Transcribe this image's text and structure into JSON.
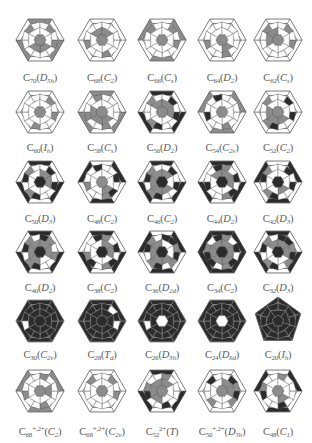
{
  "figure": {
    "colors": {
      "dark": "#2b2b2b",
      "gray": "#8c8c8c",
      "line": "#555555",
      "light": "#ffffff"
    },
    "rows": [
      {
        "cells": [
          {
            "formula": "C",
            "n": "70",
            "charge": "",
            "group": "D",
            "group_sub": "5h",
            "shape": "hex",
            "darkness": 0.15
          },
          {
            "formula": "C",
            "n": "68",
            "charge": "",
            "group": "C",
            "group_sub": "2",
            "shape": "hex",
            "darkness": 0.2
          },
          {
            "formula": "C",
            "n": "66",
            "charge": "",
            "group": "C",
            "group_sub": "s",
            "shape": "hex",
            "darkness": 0.2
          },
          {
            "formula": "C",
            "n": "64",
            "charge": "",
            "group": "D",
            "group_sub": "2",
            "shape": "hex",
            "darkness": 0.2
          },
          {
            "formula": "C",
            "n": "62",
            "charge": "",
            "group": "C",
            "group_sub": "s",
            "shape": "hex",
            "darkness": 0.2
          }
        ]
      },
      {
        "cells": [
          {
            "formula": "C",
            "n": "60",
            "charge": "",
            "group": "I",
            "group_sub": "h",
            "shape": "hex",
            "darkness": 0.2
          },
          {
            "formula": "C",
            "n": "58",
            "charge": "",
            "group": "C",
            "group_sub": "s",
            "shape": "hex",
            "darkness": 0.25
          },
          {
            "formula": "C",
            "n": "56",
            "charge": "",
            "group": "D",
            "group_sub": "2",
            "shape": "hex",
            "darkness": 0.35
          },
          {
            "formula": "C",
            "n": "54",
            "charge": "",
            "group": "C",
            "group_sub": "2v",
            "shape": "hex",
            "darkness": 0.3
          },
          {
            "formula": "C",
            "n": "52",
            "charge": "",
            "group": "C",
            "group_sub": "2",
            "shape": "hex",
            "darkness": 0.35
          }
        ]
      },
      {
        "cells": [
          {
            "formula": "C",
            "n": "50",
            "charge": "",
            "group": "D",
            "group_sub": "3",
            "shape": "hex",
            "darkness": 0.45
          },
          {
            "formula": "C",
            "n": "48",
            "charge": "",
            "group": "C",
            "group_sub": "2",
            "shape": "hex",
            "darkness": 0.4
          },
          {
            "formula": "C",
            "n": "46",
            "charge": "",
            "group": "C",
            "group_sub": "2",
            "shape": "hex",
            "darkness": 0.5
          },
          {
            "formula": "C",
            "n": "44",
            "charge": "",
            "group": "D",
            "group_sub": "2",
            "shape": "hex",
            "darkness": 0.5
          },
          {
            "formula": "C",
            "n": "42",
            "charge": "",
            "group": "D",
            "group_sub": "3",
            "shape": "hex",
            "darkness": 0.5
          }
        ]
      },
      {
        "cells": [
          {
            "formula": "C",
            "n": "40",
            "charge": "",
            "group": "D",
            "group_sub": "2",
            "shape": "hex",
            "darkness": 0.6
          },
          {
            "formula": "C",
            "n": "38",
            "charge": "",
            "group": "C",
            "group_sub": "2",
            "shape": "hex",
            "darkness": 0.6
          },
          {
            "formula": "C",
            "n": "36",
            "charge": "",
            "group": "D",
            "group_sub": "2d",
            "shape": "hex",
            "darkness": 0.65
          },
          {
            "formula": "C",
            "n": "34",
            "charge": "",
            "group": "C",
            "group_sub": "2",
            "shape": "hex",
            "darkness": 0.65
          },
          {
            "formula": "C",
            "n": "32",
            "charge": "",
            "group": "D",
            "group_sub": "3",
            "shape": "hex",
            "darkness": 0.7
          }
        ]
      },
      {
        "cells": [
          {
            "formula": "C",
            "n": "30",
            "charge": "",
            "group": "C",
            "group_sub": "2v",
            "shape": "hex",
            "darkness": 0.8
          },
          {
            "formula": "C",
            "n": "28",
            "charge": "",
            "group": "T",
            "group_sub": "d",
            "shape": "hex",
            "darkness": 0.85
          },
          {
            "formula": "C",
            "n": "26",
            "charge": "",
            "group": "D",
            "group_sub": "3h",
            "shape": "hex",
            "darkness": 0.85
          },
          {
            "formula": "C",
            "n": "24",
            "charge": "",
            "group": "D",
            "group_sub": "6d",
            "shape": "hex",
            "darkness": 0.9
          },
          {
            "formula": "C",
            "n": "20",
            "charge": "",
            "group": "I",
            "group_sub": "h",
            "shape": "pent",
            "darkness": 1.0
          }
        ]
      },
      {
        "cells": [
          {
            "formula": "C",
            "n": "68",
            "charge": "+,2+",
            "group": "C",
            "group_sub": "2",
            "shape": "hex",
            "darkness": 0.25
          },
          {
            "formula": "C",
            "n": "68",
            "charge": "+,2+",
            "group": "C",
            "group_sub": "2v",
            "shape": "hex",
            "darkness": 0.2
          },
          {
            "formula": "C",
            "n": "52",
            "charge": "2+",
            "group": "T",
            "group_sub": "",
            "shape": "hex",
            "darkness": 0.4
          },
          {
            "formula": "C",
            "n": "50",
            "charge": "+,2+",
            "group": "D",
            "group_sub": "5h",
            "shape": "hex",
            "darkness": 0.35
          },
          {
            "formula": "C",
            "n": "48",
            "charge": "",
            "group": "C",
            "group_sub": "1",
            "shape": "hex",
            "darkness": 0.35
          }
        ]
      }
    ]
  }
}
